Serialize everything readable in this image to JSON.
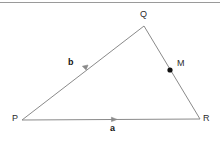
{
  "figure": {
    "background_color": "#ffffff",
    "line_color": "#8a8a8a",
    "rule_color": "#9a9a9a",
    "dot_color": "#111111",
    "text_color": "#2b2b2b",
    "bold_text_color": "#151515",
    "top_rule": {
      "name": "top-divider",
      "x1": 0,
      "y1": 2.5,
      "x2": 220,
      "y2": 2.5,
      "thickness": 1
    },
    "vertices": [
      {
        "id": "P",
        "label": "P",
        "x": 22,
        "y": 120,
        "label_x": 12,
        "label_y": 116
      },
      {
        "id": "Q",
        "label": "Q",
        "x": 144,
        "y": 26,
        "label_x": 141,
        "label_y": 11
      },
      {
        "id": "R",
        "label": "R",
        "x": 200,
        "y": 119,
        "label_x": 204,
        "label_y": 116
      }
    ],
    "edges": [
      {
        "id": "PQ",
        "from": "P",
        "to": "Q",
        "x1": 22,
        "y1": 120,
        "x2": 144,
        "y2": 26
      },
      {
        "id": "QR",
        "from": "Q",
        "to": "R",
        "x1": 144,
        "y1": 26,
        "x2": 200,
        "y2": 119
      },
      {
        "id": "PR",
        "from": "P",
        "to": "R",
        "x1": 22,
        "y1": 120,
        "x2": 200,
        "y2": 119
      }
    ],
    "vectors": [
      {
        "id": "b",
        "label": "b",
        "on_edge": "PQ",
        "label_x": 69,
        "label_y": 61,
        "arrow_tip_x": 88,
        "arrow_tip_y": 65,
        "arrow_angle_deg": -37.6
      },
      {
        "id": "a",
        "label": "a",
        "on_edge": "PR",
        "label_x": 110,
        "label_y": 125,
        "arrow_tip_x": 117,
        "arrow_tip_y": 119.5,
        "arrow_angle_deg": -0.3
      }
    ],
    "points": [
      {
        "id": "M",
        "label": "M",
        "x": 170,
        "y": 70,
        "radius": 2.6,
        "label_x": 178,
        "label_y": 60
      }
    ]
  }
}
